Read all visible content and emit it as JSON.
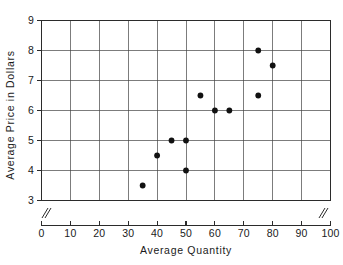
{
  "chart_data": {
    "type": "scatter",
    "title": "",
    "xlabel": "Average Quantity",
    "ylabel": "Average Price in Dollars",
    "xlim": [
      0,
      100
    ],
    "ylim": [
      3,
      9
    ],
    "xticks": [
      0,
      10,
      20,
      30,
      40,
      50,
      60,
      70,
      80,
      90,
      100
    ],
    "xtick_labels": [
      "0",
      "10",
      "20",
      "30",
      "40",
      "50",
      "60",
      "70",
      "80",
      "90",
      "100"
    ],
    "yticks": [
      3,
      4,
      5,
      6,
      7,
      8,
      9
    ],
    "ytick_labels": [
      "3",
      "4",
      "5",
      "6",
      "7",
      "8",
      "9"
    ],
    "grid": true,
    "legend": "none",
    "axis_break_x": true,
    "axis_break_y": true,
    "marker": "filled-circle",
    "marker_color": "#111111",
    "points": [
      {
        "x": 35,
        "y": 3.5
      },
      {
        "x": 40,
        "y": 4.5
      },
      {
        "x": 45,
        "y": 5.0
      },
      {
        "x": 50,
        "y": 5.0
      },
      {
        "x": 50,
        "y": 4.0
      },
      {
        "x": 55,
        "y": 6.5
      },
      {
        "x": 60,
        "y": 6.0
      },
      {
        "x": 65,
        "y": 6.0
      },
      {
        "x": 75,
        "y": 8.0
      },
      {
        "x": 75,
        "y": 6.5
      },
      {
        "x": 80,
        "y": 7.5
      }
    ]
  },
  "figure": {
    "background_color": "#ffffff",
    "grid_color": "#444444",
    "frame_color": "#2b2b2b"
  }
}
